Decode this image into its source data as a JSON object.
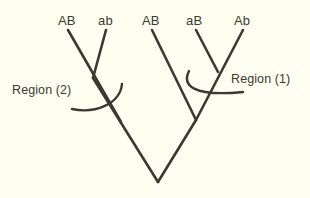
{
  "figure": {
    "type": "phylogenetic-tree-diagram",
    "background_color": "#fffef0",
    "line_color": "#3a3a32",
    "text_color": "#3a3a32",
    "width": 310,
    "height": 198
  },
  "tips": [
    {
      "label": "AB",
      "x": 68,
      "y": 20
    },
    {
      "label": "ab",
      "x": 106,
      "y": 20
    },
    {
      "label": "AB",
      "x": 152,
      "y": 20
    },
    {
      "label": "aB",
      "x": 196,
      "y": 20
    },
    {
      "label": "Ab",
      "x": 243,
      "y": 20
    }
  ],
  "annotations": [
    {
      "label": "Region (2)",
      "x": 12,
      "y": 84
    },
    {
      "label": "Region (1)",
      "x": 231,
      "y": 73
    }
  ],
  "branches": {
    "tip_AB1": "M68,30 L121,122",
    "tip_ab1": "M106,30 L93,78",
    "node_left_stem": "M93,78 L158,182",
    "tip_AB2": "M152,30 L196,120",
    "tip_aB": "M196,30 L218,72",
    "tip_Ab": "M243,30 L196,120",
    "node_right_stem": "M196,120 L158,182"
  },
  "region_arcs": {
    "region2_arc": "M72,109 C95,114 120,104 122,84",
    "region1_arc": "M189,71 C182,85 192,97 243,92"
  }
}
